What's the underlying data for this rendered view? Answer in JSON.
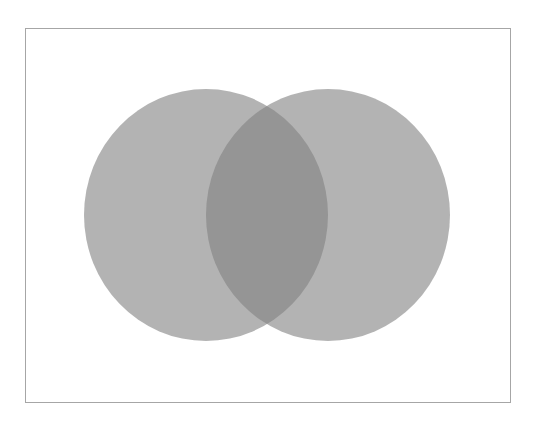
{
  "diagram": {
    "type": "venn",
    "set_count": 2,
    "labels": [],
    "frame": {
      "x": 25,
      "y": 28,
      "width": 485,
      "height": 374,
      "stroke": "#a6a6a6"
    },
    "sets": [
      {
        "id": "left",
        "cx": 206,
        "cy": 215,
        "rx": 122,
        "ry": 126,
        "fill": "#808080",
        "opacity": 0.6
      },
      {
        "id": "right",
        "cx": 328,
        "cy": 215,
        "rx": 122,
        "ry": 126,
        "fill": "#808080",
        "opacity": 0.6
      }
    ],
    "colors": {
      "background": "#ffffff",
      "single_region": "#b3b3b3",
      "overlap_region": "#9c9c9c"
    }
  }
}
